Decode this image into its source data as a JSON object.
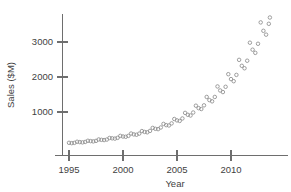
{
  "chart_data": {
    "type": "scatter",
    "title": "",
    "xlabel": "Year",
    "ylabel": "Sales ($M)",
    "xlim": [
      1994.2,
      1913.6
    ],
    "x_axis_range": [
      1994.2,
      2013.8
    ],
    "ylim": [
      0,
      3900
    ],
    "grid": false,
    "legend": null,
    "marker": "open-circle",
    "marker_color": "#8e8e8e",
    "x_ticks": [
      1995,
      2000,
      2005,
      2010
    ],
    "x_tick_labels": [
      "1995",
      "2000",
      "2005",
      "2010"
    ],
    "y_ticks": [
      1000,
      2000,
      3000
    ],
    "y_tick_labels": [
      "1000",
      "2000",
      "3000"
    ],
    "series": [
      {
        "name": "Quarterly Sales",
        "points": [
          [
            1995.0,
            120
          ],
          [
            1995.25,
            110
          ],
          [
            1995.5,
            118
          ],
          [
            1995.75,
            150
          ],
          [
            1996.0,
            140
          ],
          [
            1996.25,
            132
          ],
          [
            1996.5,
            145
          ],
          [
            1996.75,
            178
          ],
          [
            1997.0,
            168
          ],
          [
            1997.25,
            160
          ],
          [
            1997.5,
            175
          ],
          [
            1997.75,
            215
          ],
          [
            1998.0,
            205
          ],
          [
            1998.25,
            198
          ],
          [
            1998.5,
            212
          ],
          [
            1998.75,
            258
          ],
          [
            1999.0,
            248
          ],
          [
            1999.25,
            240
          ],
          [
            1999.5,
            262
          ],
          [
            1999.75,
            318
          ],
          [
            2000.0,
            300
          ],
          [
            2000.25,
            292
          ],
          [
            2000.5,
            318
          ],
          [
            2000.75,
            385
          ],
          [
            2001.0,
            360
          ],
          [
            2001.25,
            350
          ],
          [
            2001.5,
            382
          ],
          [
            2001.75,
            455
          ],
          [
            2002.0,
            430
          ],
          [
            2002.25,
            420
          ],
          [
            2002.5,
            460
          ],
          [
            2002.75,
            545
          ],
          [
            2003.0,
            520
          ],
          [
            2003.25,
            510
          ],
          [
            2003.5,
            558
          ],
          [
            2003.75,
            660
          ],
          [
            2004.0,
            625
          ],
          [
            2004.25,
            615
          ],
          [
            2004.5,
            675
          ],
          [
            2004.75,
            800
          ],
          [
            2005.0,
            760
          ],
          [
            2005.25,
            745
          ],
          [
            2005.5,
            815
          ],
          [
            2005.75,
            975
          ],
          [
            2006.0,
            920
          ],
          [
            2006.25,
            900
          ],
          [
            2006.5,
            985
          ],
          [
            2006.75,
            1180
          ],
          [
            2007.0,
            1110
          ],
          [
            2007.25,
            1085
          ],
          [
            2007.5,
            1190
          ],
          [
            2007.75,
            1430
          ],
          [
            2008.0,
            1340
          ],
          [
            2008.25,
            1305
          ],
          [
            2008.5,
            1430
          ],
          [
            2008.75,
            1730
          ],
          [
            2009.0,
            1615
          ],
          [
            2009.25,
            1570
          ],
          [
            2009.5,
            1720
          ],
          [
            2009.75,
            2080
          ],
          [
            2010.0,
            1940
          ],
          [
            2010.25,
            1880
          ],
          [
            2010.5,
            2060
          ],
          [
            2010.75,
            2490
          ],
          [
            2011.0,
            2320
          ],
          [
            2011.25,
            2250
          ],
          [
            2011.5,
            2465
          ],
          [
            2011.75,
            2980
          ],
          [
            2012.0,
            2780
          ],
          [
            2012.25,
            2690
          ],
          [
            2012.5,
            2950
          ],
          [
            2012.75,
            3560
          ],
          [
            2013.0,
            3320
          ],
          [
            2013.25,
            3210
          ],
          [
            2013.5,
            3520
          ],
          [
            2013.6,
            3700
          ]
        ]
      }
    ]
  },
  "axes": {
    "x_title": "Year",
    "y_title": "Sales ($M)"
  }
}
